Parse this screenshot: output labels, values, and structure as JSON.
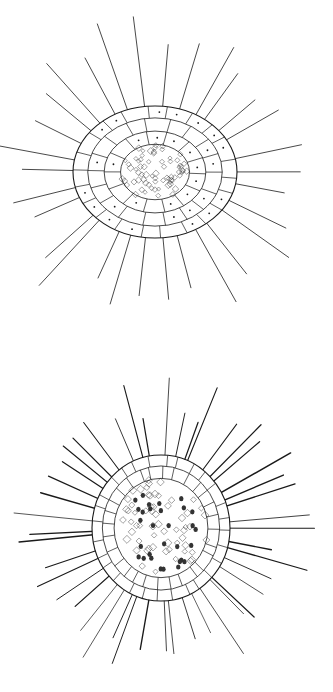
{
  "figures": [
    {
      "name": "oval-radiolarian",
      "shape": "ellipse",
      "center": [
        155,
        172
      ],
      "radii": [
        82,
        66
      ],
      "ray_count": 30,
      "ray_length": 150
    },
    {
      "name": "round-radiolarian",
      "shape": "circle",
      "center": [
        161,
        528
      ],
      "radii": [
        69,
        73
      ],
      "ray_count": 44,
      "ray_length": 140
    }
  ],
  "colors": {
    "ink": "#1a1a1a",
    "background": "#ffffff"
  }
}
